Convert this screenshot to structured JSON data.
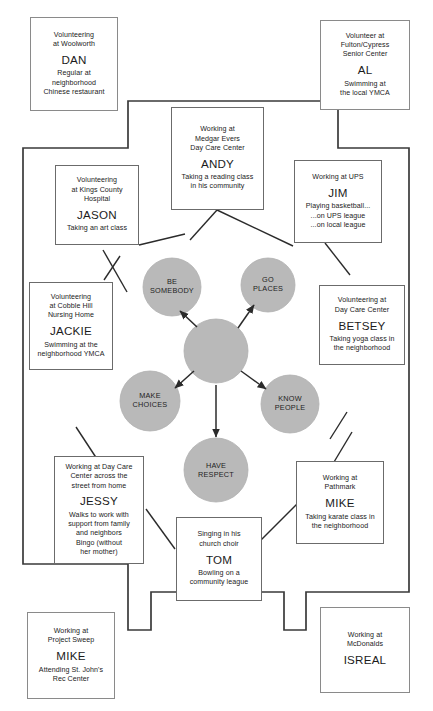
{
  "diagram": {
    "colors": {
      "circle_fill": "#b9b9b9",
      "circle_stroke": "#a8a8a8",
      "line": "#2b2b2b",
      "box_border": "#6b6b6b",
      "text": "#1b1b1b",
      "background": "#ffffff"
    },
    "hub": {
      "center_label": "",
      "goals": [
        {
          "id": "be-somebody",
          "label": "BE\nSOMEBODY",
          "line1": "BE",
          "line2": "SOMEBODY"
        },
        {
          "id": "go-places",
          "label": "GO\nPLACES",
          "line1": "GO",
          "line2": "PLACES"
        },
        {
          "id": "make-choices",
          "label": "MAKE\nCHOICES",
          "line1": "MAKE",
          "line2": "CHOICES"
        },
        {
          "id": "know-people",
          "label": "KNOW\nPEOPLE",
          "line1": "KNOW",
          "line2": "PEOPLE"
        },
        {
          "id": "have-respect",
          "label": "HAVE\nRESPECT",
          "line1": "HAVE",
          "line2": "RESPECT"
        }
      ]
    },
    "inner_nodes": [
      {
        "id": "andy",
        "name": "ANDY",
        "top": "Working at\nMedgar Evers\nDay Care Center",
        "bottom": "Taking a reading class\nin his community"
      },
      {
        "id": "jason",
        "name": "JASON",
        "top": "Volunteering\nat Kings County\nHospital",
        "bottom": "Taking an art class"
      },
      {
        "id": "jim",
        "name": "JIM",
        "top": "Working at UPS",
        "bottom": "Playing basketball...\n...on UPS league\n...on local league"
      },
      {
        "id": "jackie",
        "name": "JACKIE",
        "top": "Volunteering\nat Cobble Hill\nNursing Home",
        "bottom": "Swimming at the\nneighborhood YMCA"
      },
      {
        "id": "betsey",
        "name": "BETSEY",
        "top": "Volunteering at\nDay Care Center",
        "bottom": "Taking yoga class in\nthe neighborhood"
      },
      {
        "id": "jessy",
        "name": "JESSY",
        "top": "Working at Day Care\nCenter across the\nstreet from home",
        "bottom": "Walks to work with\nsupport from family\nand neighbors\nBingo (without\nher mother)"
      },
      {
        "id": "mike-pathmark",
        "name": "MIKE",
        "top": "Working at\nPathmark",
        "bottom": "Taking karate class in\nthe neighborhood"
      },
      {
        "id": "tom",
        "name": "TOM",
        "top": "Singing in his\nchurch choir",
        "bottom": "Bowling on a\ncommunity league"
      }
    ],
    "outer_nodes": [
      {
        "id": "dan",
        "name": "DAN",
        "top": "Volunteering\nat Woolworth",
        "bottom": "Regular at\nneighborhood\nChinese restaurant"
      },
      {
        "id": "al",
        "name": "AL",
        "top": "Volunteer at\nFulton/Cypress\nSenior Center",
        "bottom": "Swimming at\nthe local YMCA"
      },
      {
        "id": "mike-project-sweep",
        "name": "MIKE",
        "top": "Working at\nProject Sweep",
        "bottom": "Attending St. John's\nRec Center"
      },
      {
        "id": "isreal",
        "name": "ISREAL",
        "top": "Working at\nMcDonalds",
        "bottom": ""
      }
    ]
  }
}
